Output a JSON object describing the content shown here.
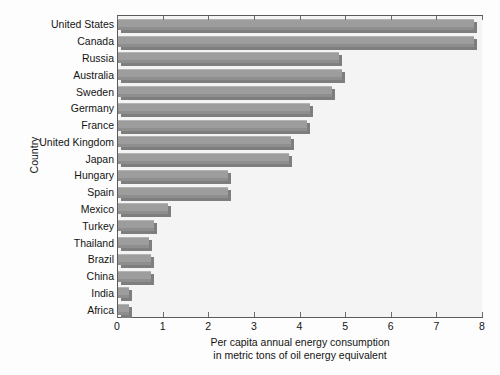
{
  "chart_data": {
    "type": "bar",
    "orientation": "horizontal",
    "title": "",
    "xlabel": "Per capita annual energy consumption\nin metric tons of oil energy equivalent",
    "xlabel_line1": "Per capita annual energy consumption",
    "xlabel_line2": "in metric tons of oil energy equivalent",
    "ylabel": "Country",
    "xlim": [
      0,
      8
    ],
    "xticks": [
      0,
      1,
      2,
      3,
      4,
      5,
      6,
      7,
      8
    ],
    "xtick_labels": [
      "0",
      "1",
      "2",
      "3",
      "4",
      "5",
      "6",
      "7",
      "8"
    ],
    "grid": false,
    "legend": null,
    "categories": [
      "United States",
      "Canada",
      "Russia",
      "Australia",
      "Sweden",
      "Germany",
      "France",
      "United Kingdom",
      "Japan",
      "Hungary",
      "Spain",
      "Mexico",
      "Turkey",
      "Thailand",
      "Brazil",
      "China",
      "India",
      "Africa"
    ],
    "values": [
      7.8,
      7.8,
      4.85,
      4.9,
      4.7,
      4.2,
      4.15,
      3.8,
      3.75,
      2.4,
      2.4,
      1.1,
      0.78,
      0.68,
      0.73,
      0.73,
      0.25,
      0.25
    ],
    "bar_color": "#9d9d9d",
    "bar_edge_color": "#7e7e7e",
    "plot_background": "#f4f4f4",
    "axis_color": "#5a5a5a"
  }
}
